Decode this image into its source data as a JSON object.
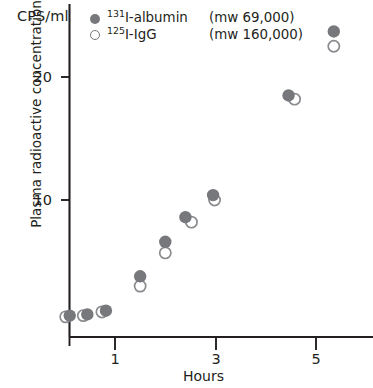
{
  "chart_data": {
    "type": "scatter",
    "title": "",
    "xlabel": "Hours",
    "ylabel": "Plasma radioactive concentration",
    "y_unit_label": "CPS/ml",
    "xlim": [
      0,
      6
    ],
    "ylim": [
      0,
      26
    ],
    "xticks": [
      1,
      3,
      5
    ],
    "xticklabels": [
      "1",
      "3",
      "5"
    ],
    "yticks": [
      10,
      20
    ],
    "yticklabels": [
      "10",
      "20"
    ],
    "grid": false,
    "legend_position": "top-left-inside",
    "series": [
      {
        "name": "131I-albumin (mw 69,000)",
        "label_isotope": "131",
        "label_text": "I-albumin",
        "label_mw": "(mw 69,000)",
        "marker": "filled-circle",
        "color": "#77787b",
        "x": [
          0.1,
          0.45,
          0.82,
          1.5,
          2.0,
          2.4,
          2.95,
          4.45,
          5.35
        ],
        "y": [
          0.6,
          0.7,
          1.0,
          3.8,
          6.6,
          8.6,
          10.4,
          18.5,
          23.7
        ]
      },
      {
        "name": "125I-IgG (mw 160,000)",
        "label_isotope": "125",
        "label_text": "I-IgG",
        "label_mw": "(mw 160,000)",
        "marker": "open-circle",
        "color": "#ffffff",
        "edgecolor": "#8a8b8e",
        "x": [
          0.02,
          0.37,
          0.74,
          1.5,
          2.0,
          2.52,
          2.98,
          4.57,
          5.35
        ],
        "y": [
          0.5,
          0.6,
          0.9,
          3.0,
          5.7,
          8.2,
          10.0,
          18.2,
          22.5
        ]
      }
    ]
  },
  "axes": {
    "x_title": "Hours",
    "y_title": "Plasma radioactive concentration",
    "unit": "CPS/ml",
    "xtick_1": "1",
    "xtick_3": "3",
    "xtick_5": "5",
    "ytick_10": "10",
    "ytick_20": "20"
  },
  "legend": {
    "albumin_isotope": "131",
    "albumin_name": "I-albumin",
    "albumin_mw": "(mw 69,000)",
    "igg_isotope": "125",
    "igg_name": "I-IgG",
    "igg_mw": "(mw 160,000)"
  },
  "colors": {
    "marker_fill": "#77787b",
    "marker_edge": "#8a8b8e",
    "axis": "#231f20",
    "text": "#231f20",
    "background": "#ffffff"
  }
}
